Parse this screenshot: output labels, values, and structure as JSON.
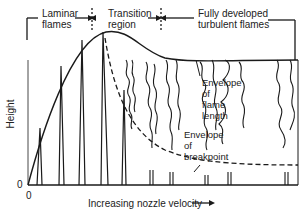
{
  "figure": {
    "regions": [
      {
        "id": "laminar",
        "label_line1": "Laminar",
        "label_line2": "flames"
      },
      {
        "id": "transition",
        "label_line1": "Transition",
        "label_line2": "region"
      },
      {
        "id": "turbulent",
        "label_line1": "Fully developed",
        "label_line2": "turbulent flames"
      }
    ],
    "annotations": {
      "flame_length": {
        "line1": "Envelope",
        "line2": "of",
        "line3": "flame",
        "line4": "length"
      },
      "breakpoint": {
        "line1": "Envelope",
        "line2": "of",
        "line3": "breakpoint"
      }
    },
    "axes": {
      "y_label": "Height",
      "y_origin": "0",
      "x_origin": "0",
      "x_label": "Increasing nozzle velocity",
      "x_arrow": "⟶"
    },
    "colors": {
      "ink": "#1a1a1a",
      "background": "#ffffff"
    }
  }
}
